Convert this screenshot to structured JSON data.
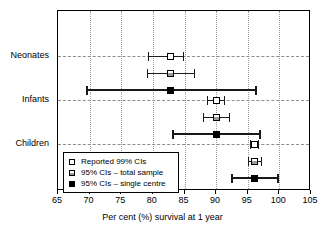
{
  "chart_data": {
    "type": "scatter",
    "title": "",
    "xlabel": "Per cent (%) survival at 1 year",
    "ylabel": "",
    "xlim": [
      65,
      105
    ],
    "xticks": [
      65,
      70,
      75,
      80,
      85,
      90,
      95,
      100,
      105
    ],
    "xticklabels": [
      "65",
      "70",
      "75",
      "80",
      "85",
      "90",
      "95",
      "100",
      "105"
    ],
    "grid": "vertical-dotted-and-horizontal-dashed-at-categories",
    "categories": [
      "Neonates",
      "Infants",
      "Children"
    ],
    "legend_position": "lower-left-inside",
    "series": [
      {
        "name": "Reported 99% CIs",
        "marker": "open-square",
        "points": [
          {
            "category": "Neonates",
            "estimate": 82.8,
            "low": 79.2,
            "high": 84.8
          },
          {
            "category": "Infants",
            "estimate": 90.0,
            "low": 88.6,
            "high": 91.3
          },
          {
            "category": "Children",
            "estimate": 96.1,
            "low": 95.4,
            "high": 96.6
          }
        ]
      },
      {
        "name": "95% CIs – total sample",
        "marker": "half-filled-square",
        "points": [
          {
            "category": "Neonates",
            "estimate": 82.8,
            "low": 79.0,
            "high": 86.5
          },
          {
            "category": "Infants",
            "estimate": 90.0,
            "low": 87.9,
            "high": 92.0
          },
          {
            "category": "Children",
            "estimate": 96.1,
            "low": 95.1,
            "high": 97.1
          }
        ]
      },
      {
        "name": "95% CIs – single centre",
        "marker": "filled-square",
        "points": [
          {
            "category": "Neonates",
            "estimate": 82.8,
            "low": 69.5,
            "high": 96.1
          },
          {
            "category": "Infants",
            "estimate": 90.0,
            "low": 83.1,
            "high": 96.8
          },
          {
            "category": "Children",
            "estimate": 96.1,
            "low": 92.3,
            "high": 99.6
          }
        ]
      }
    ]
  },
  "axis": {
    "x_title": "Per cent (%) survival at 1 year",
    "tick_labels": [
      "65",
      "70",
      "75",
      "80",
      "85",
      "90",
      "95",
      "100",
      "105"
    ],
    "category_labels": [
      "Neonates",
      "Infants",
      "Children"
    ]
  },
  "legend": {
    "items": [
      {
        "label": "Reported 99% CIs",
        "marker": "open-square"
      },
      {
        "label": "95% CIs – total sample",
        "marker": "half-filled-square"
      },
      {
        "label": "95% CIs – single centre",
        "marker": "filled-square"
      }
    ]
  },
  "colors": {
    "line": "#1a1a1a",
    "grid_dotted": "#9a9a9a",
    "grid_dashed": "#8d8d8d",
    "background": "#ffffff",
    "frame": "#000000"
  }
}
